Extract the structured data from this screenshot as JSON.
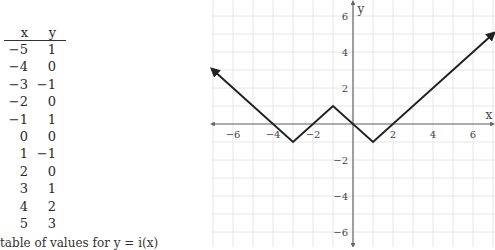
{
  "table": {
    "headers": {
      "x": "x",
      "y": "y"
    },
    "rows": [
      {
        "x": "−5",
        "y": "1"
      },
      {
        "x": "−4",
        "y": "0"
      },
      {
        "x": "−3",
        "y": "−1"
      },
      {
        "x": "−2",
        "y": "0"
      },
      {
        "x": "−1",
        "y": "1"
      },
      {
        "x": "0",
        "y": "0"
      },
      {
        "x": "1",
        "y": "−1"
      },
      {
        "x": "2",
        "y": "0"
      },
      {
        "x": "3",
        "y": "1"
      },
      {
        "x": "4",
        "y": "2"
      },
      {
        "x": "5",
        "y": "3"
      }
    ],
    "caption": "table of values for y = i(x)"
  },
  "chart_data": {
    "type": "line",
    "title": "",
    "xlabel": "x",
    "ylabel": "y",
    "xlim": [
      -7,
      7
    ],
    "ylim": [
      -7,
      7
    ],
    "grid": true,
    "x_ticks": [
      -6,
      -4,
      -2,
      2,
      4,
      6
    ],
    "y_ticks": [
      -6,
      -4,
      -2,
      2,
      4,
      6
    ],
    "x_tick_labels": [
      "−6",
      "−4",
      "−2",
      "2",
      "4",
      "6"
    ],
    "y_tick_labels": [
      "−6",
      "−4",
      "−2",
      "2",
      "4",
      "6"
    ],
    "series": [
      {
        "name": "y = i(x)",
        "x": [
          -7,
          -3,
          -1,
          1,
          7
        ],
        "y": [
          3,
          -1,
          1,
          -1,
          5
        ],
        "arrows_at_ends": true
      }
    ],
    "table_points": {
      "x": [
        -5,
        -4,
        -3,
        -2,
        -1,
        0,
        1,
        2,
        3,
        4,
        5
      ],
      "y": [
        1,
        0,
        -1,
        0,
        1,
        0,
        -1,
        0,
        1,
        2,
        3
      ]
    }
  },
  "colors": {
    "grid": "#e6e6e6",
    "axis": "#666666",
    "curve": "#222222"
  }
}
